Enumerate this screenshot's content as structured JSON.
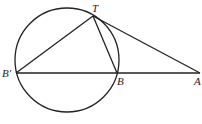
{
  "diagram": {
    "title": "",
    "points": {
      "T": {
        "label": "T"
      },
      "B_prime": {
        "label": "B′"
      },
      "B": {
        "label": "B"
      },
      "A": {
        "label": "A"
      }
    },
    "segments": [
      {
        "from": "B_prime",
        "to": "A",
        "name": "secant-line"
      },
      {
        "from": "B_prime",
        "to": "T",
        "name": "chord-b-prime-t"
      },
      {
        "from": "T",
        "to": "B",
        "name": "chord-t-b"
      },
      {
        "from": "T",
        "to": "A",
        "name": "tangent-line"
      }
    ],
    "shapes": [
      {
        "type": "circle",
        "name": "circle",
        "passes_through": [
          "T",
          "B_prime",
          "B"
        ]
      }
    ],
    "colors": {
      "stroke": "#222222",
      "background": "#ffffff"
    }
  }
}
